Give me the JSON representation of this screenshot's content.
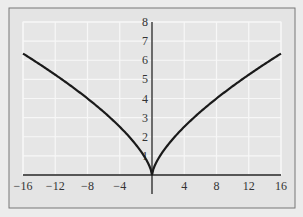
{
  "chart_data": {
    "type": "line",
    "title": "",
    "xlabel": "",
    "ylabel": "",
    "function": "y = x^(2/3)",
    "xlim": [
      -16,
      16
    ],
    "ylim": [
      0,
      8
    ],
    "grid": true,
    "x_ticks": [
      -16,
      -12,
      -8,
      -4,
      4,
      8,
      12,
      16
    ],
    "x_tick_labels": [
      "−16",
      "−12",
      "−8",
      "−4",
      "4",
      "8",
      "12",
      "16"
    ],
    "y_ticks": [
      1,
      2,
      3,
      4,
      5,
      6,
      7,
      8
    ],
    "y_tick_labels": [
      "1",
      "2",
      "3",
      "4",
      "5",
      "6",
      "7",
      "8"
    ],
    "series": [
      {
        "name": "y = x^(2/3)",
        "x": [
          -16,
          -12,
          -8,
          -4,
          -1,
          0,
          1,
          4,
          8,
          12,
          16
        ],
        "y": [
          6.35,
          5.24,
          4.0,
          2.52,
          1.0,
          0,
          1.0,
          2.52,
          4.0,
          5.24,
          6.35
        ]
      }
    ],
    "colors": {
      "background": "#e6e6e6",
      "grid": "#f7f7f7",
      "curve": "#1a1a1a",
      "axis": "#222222",
      "frame": "#777777"
    }
  }
}
